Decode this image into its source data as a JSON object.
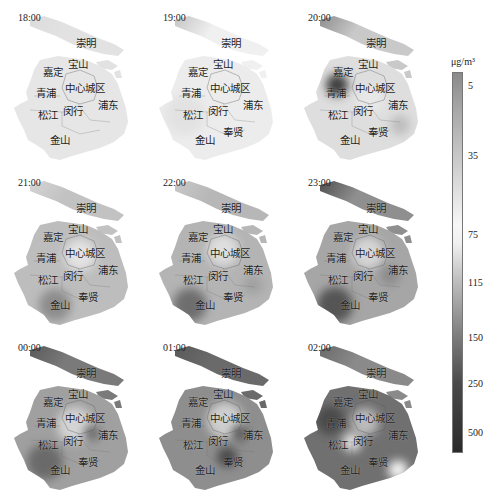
{
  "figure": {
    "type": "choropleth-grid",
    "region": "Shanghai",
    "layout": {
      "rows": 3,
      "cols": 3
    }
  },
  "colorbar": {
    "unit": "μg/m³",
    "ticks": [
      {
        "label": "5",
        "pos": 0.035
      },
      {
        "label": "35",
        "pos": 0.218
      },
      {
        "label": "75",
        "pos": 0.425
      },
      {
        "label": "115",
        "pos": 0.551
      },
      {
        "label": "150",
        "pos": 0.696
      },
      {
        "label": "250",
        "pos": 0.816
      },
      {
        "label": "500",
        "pos": 0.945
      }
    ],
    "gradient_stops": [
      {
        "pos": 0.0,
        "color": "#8a8a8a"
      },
      {
        "pos": 0.1,
        "color": "#a8a8a8"
      },
      {
        "pos": 0.25,
        "color": "#cfcfcf"
      },
      {
        "pos": 0.4,
        "color": "#f7f7f7"
      },
      {
        "pos": 0.45,
        "color": "#f0f0f0"
      },
      {
        "pos": 0.55,
        "color": "#bdbdbd"
      },
      {
        "pos": 0.7,
        "color": "#7a7a7a"
      },
      {
        "pos": 0.82,
        "color": "#4a4a4a"
      },
      {
        "pos": 1.0,
        "color": "#2a2a2a"
      }
    ]
  },
  "districts": [
    {
      "key": "chongming",
      "label": "崇明",
      "x": 86,
      "y": 43
    },
    {
      "key": "baoshan",
      "label": "宝山",
      "x": 78,
      "y": 64
    },
    {
      "key": "jiading",
      "label": "嘉定",
      "x": 53,
      "y": 72
    },
    {
      "key": "qingpu",
      "label": "青浦",
      "x": 46,
      "y": 93
    },
    {
      "key": "center",
      "label": "中心城区",
      "x": 85,
      "y": 88
    },
    {
      "key": "pudong",
      "label": "浦东",
      "x": 108,
      "y": 105
    },
    {
      "key": "songjiang",
      "label": "松江",
      "x": 48,
      "y": 115
    },
    {
      "key": "minhang",
      "label": "闵行",
      "x": 73,
      "y": 111
    },
    {
      "key": "fengxian",
      "label": "奉贤",
      "x": 88,
      "y": 132
    },
    {
      "key": "jinshan",
      "label": "金山",
      "x": 60,
      "y": 140
    }
  ],
  "panels": [
    {
      "time": "18:00",
      "x": 0,
      "y": 0,
      "hide": [
        "fengxian"
      ],
      "base": "#e6e6e6",
      "island": "#e2e2e2",
      "islandHead": "#dcdcdc",
      "blobs": []
    },
    {
      "time": "19:00",
      "x": 145,
      "y": 0,
      "hide": [],
      "base": "#ececec",
      "island": "#f0f0f0",
      "islandHead": "#c4c4c4",
      "blobs": [
        {
          "cx": 40,
          "cy": 115,
          "r": 20,
          "c": "#e2e2e2"
        }
      ]
    },
    {
      "time": "20:00",
      "x": 290,
      "y": 0,
      "hide": [],
      "base": "#dedede",
      "island": "#c9c9c9",
      "islandHead": "#8e8e8e",
      "blobs": [
        {
          "cx": 47,
          "cy": 85,
          "r": 11,
          "c": "#3e3e3e"
        },
        {
          "cx": 110,
          "cy": 125,
          "r": 10,
          "c": "#bdbdbd"
        },
        {
          "cx": 80,
          "cy": 100,
          "r": 14,
          "c": "#e8e8e8"
        }
      ]
    },
    {
      "time": "21:00",
      "x": 0,
      "y": 165,
      "hide": [],
      "base": "#bdbdbd",
      "island": "#c2c2c2",
      "islandHead": "#d4d4d4",
      "blobs": [
        {
          "cx": 112,
          "cy": 43,
          "r": 10,
          "c": "#5a5a5a"
        },
        {
          "cx": 55,
          "cy": 140,
          "r": 16,
          "c": "#8c8c8c"
        },
        {
          "cx": 80,
          "cy": 90,
          "r": 16,
          "c": "#e3e3e3"
        }
      ]
    },
    {
      "time": "22:00",
      "x": 145,
      "y": 165,
      "hide": [],
      "base": "#b4b4b4",
      "island": "#b7b7b7",
      "islandHead": "#c8c8c8",
      "blobs": [
        {
          "cx": 80,
          "cy": 35,
          "r": 9,
          "c": "#8a8a8a"
        },
        {
          "cx": 45,
          "cy": 140,
          "r": 17,
          "c": "#6e6e6e"
        },
        {
          "cx": 78,
          "cy": 85,
          "r": 16,
          "c": "#dedede"
        },
        {
          "cx": 108,
          "cy": 120,
          "r": 10,
          "c": "#a0a0a0"
        }
      ]
    },
    {
      "time": "23:00",
      "x": 290,
      "y": 165,
      "hide": [],
      "base": "#a6a6a6",
      "island": "#8f8f8f",
      "islandHead": "#4f4f4f",
      "blobs": [
        {
          "cx": 45,
          "cy": 140,
          "r": 18,
          "c": "#555555"
        },
        {
          "cx": 78,
          "cy": 88,
          "r": 16,
          "c": "#d6d6d6"
        },
        {
          "cx": 100,
          "cy": 110,
          "r": 10,
          "c": "#8a8a8a"
        }
      ]
    },
    {
      "time": "00:00",
      "x": 0,
      "y": 330,
      "hide": [],
      "base": "#a0a0a0",
      "island": "#7a7a7a",
      "islandHead": "#5a5a5a",
      "blobs": [
        {
          "cx": 45,
          "cy": 132,
          "r": 18,
          "c": "#6a6a6a"
        },
        {
          "cx": 75,
          "cy": 95,
          "r": 18,
          "c": "#d4d4d4"
        },
        {
          "cx": 92,
          "cy": 103,
          "r": 8,
          "c": "#6a6a6a"
        }
      ]
    },
    {
      "time": "01:00",
      "x": 145,
      "y": 330,
      "hide": [],
      "base": "#8e8e8e",
      "island": "#6a6a6a",
      "islandHead": "#5a5a5a",
      "blobs": [
        {
          "cx": 80,
          "cy": 90,
          "r": 18,
          "c": "#cfcfcf"
        },
        {
          "cx": 82,
          "cy": 127,
          "r": 10,
          "c": "#4a4a4a"
        },
        {
          "cx": 95,
          "cy": 103,
          "r": 8,
          "c": "#5a5a5a"
        }
      ]
    },
    {
      "time": "02:00",
      "x": 290,
      "y": 330,
      "hide": [],
      "base": "#707070",
      "island": "#8a8a8a",
      "islandHead": "#6a6a6a",
      "blobs": [
        {
          "cx": 40,
          "cy": 90,
          "r": 14,
          "c": "#4a4a4a"
        },
        {
          "cx": 75,
          "cy": 92,
          "r": 14,
          "c": "#bbbbbb"
        },
        {
          "cx": 108,
          "cy": 140,
          "r": 10,
          "c": "#f2f2f2"
        },
        {
          "cx": 62,
          "cy": 112,
          "r": 10,
          "c": "#dcdcdc"
        }
      ]
    }
  ]
}
